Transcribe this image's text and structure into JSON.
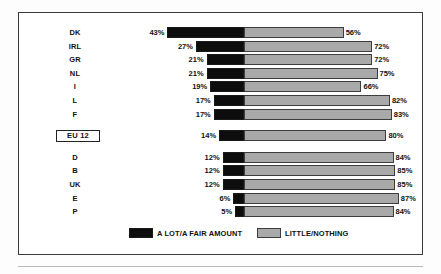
{
  "chart_data": {
    "type": "bar",
    "subtype": "diverging-stacked-bar",
    "title": "",
    "xlabel": "",
    "ylabel": "",
    "grid": false,
    "legend_position": "bottom",
    "categories": [
      "DK",
      "IRL",
      "GR",
      "NL",
      "I",
      "L",
      "F",
      "EU 12",
      "D",
      "B",
      "UK",
      "E",
      "P"
    ],
    "series": [
      {
        "name": "A LOT/A FAIR AMOUNT",
        "color": "#0d0d0d",
        "direction": "left",
        "values": [
          43,
          27,
          21,
          21,
          19,
          17,
          17,
          14,
          12,
          12,
          12,
          6,
          5
        ]
      },
      {
        "name": "LITTLE/NOTHING",
        "color": "#a9a9a9",
        "direction": "right",
        "values": [
          56,
          72,
          72,
          75,
          66,
          82,
          83,
          80,
          84,
          85,
          85,
          87,
          84
        ]
      }
    ],
    "rows": [
      {
        "label": "DK",
        "boxed": false,
        "group": 0,
        "left_value": 43,
        "left_label": "43%",
        "right_value": 56,
        "right_label": "56%"
      },
      {
        "label": "IRL",
        "boxed": false,
        "group": 0,
        "left_value": 27,
        "left_label": "27%",
        "right_value": 72,
        "right_label": "72%"
      },
      {
        "label": "GR",
        "boxed": false,
        "group": 0,
        "left_value": 21,
        "left_label": "21%",
        "right_value": 72,
        "right_label": "72%"
      },
      {
        "label": "NL",
        "boxed": false,
        "group": 0,
        "left_value": 21,
        "left_label": "21%",
        "right_value": 75,
        "right_label": "75%"
      },
      {
        "label": "I",
        "boxed": false,
        "group": 0,
        "left_value": 19,
        "left_label": "19%",
        "right_value": 66,
        "right_label": "66%"
      },
      {
        "label": "L",
        "boxed": false,
        "group": 0,
        "left_value": 17,
        "left_label": "17%",
        "right_value": 82,
        "right_label": "82%"
      },
      {
        "label": "F",
        "boxed": false,
        "group": 0,
        "left_value": 17,
        "left_label": "17%",
        "right_value": 83,
        "right_label": "83%"
      },
      {
        "label": "EU 12",
        "boxed": true,
        "group": 1,
        "left_value": 14,
        "left_label": "14%",
        "right_value": 80,
        "right_label": "80%"
      },
      {
        "label": "D",
        "boxed": false,
        "group": 2,
        "left_value": 12,
        "left_label": "12%",
        "right_value": 84,
        "right_label": "84%"
      },
      {
        "label": "B",
        "boxed": false,
        "group": 2,
        "left_value": 12,
        "left_label": "12%",
        "right_value": 85,
        "right_label": "85%"
      },
      {
        "label": "UK",
        "boxed": false,
        "group": 2,
        "left_value": 12,
        "left_label": "12%",
        "right_value": 85,
        "right_label": "85%"
      },
      {
        "label": "E",
        "boxed": false,
        "group": 2,
        "left_value": 6,
        "left_label": "6%",
        "right_value": 87,
        "right_label": "87%"
      },
      {
        "label": "P",
        "boxed": false,
        "group": 2,
        "left_value": 5,
        "left_label": "5%",
        "right_value": 84,
        "right_label": "84%"
      }
    ]
  },
  "legend": {
    "items": [
      {
        "label": "A LOT/A FAIR AMOUNT",
        "swatch": "black"
      },
      {
        "label": "LITTLE/NOTHING",
        "swatch": "gray"
      }
    ]
  }
}
